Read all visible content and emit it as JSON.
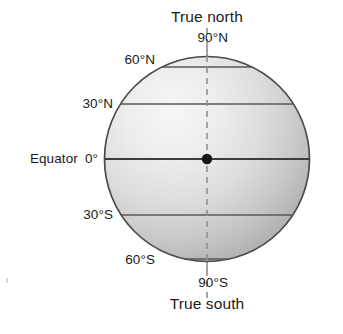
{
  "diagram": {
    "labels": {
      "true_north": "True north",
      "true_south": "True south",
      "pole_north": "90°N",
      "pole_south": "90°S",
      "lat_60n": "60°N",
      "lat_30n": "30°N",
      "equator_name": "Equator",
      "equator_value": "0°",
      "lat_30s": "30°S",
      "lat_60s": "60°S"
    },
    "colors": {
      "outline": "#4a4a4a",
      "latitude_line": "#5a5a5a",
      "axis_dash": "#8a8a8a",
      "center_dot": "#1a1a1a",
      "globe_light": "#f2f2f2",
      "globe_mid": "#d6d6d6",
      "globe_dark": "#adadad",
      "text": "#1a1a1a",
      "background": "#ffffff"
    },
    "geometry": {
      "center_x": 207,
      "center_y": 159,
      "radius": 103,
      "axis_top_y": 28,
      "axis_bottom_y": 300
    },
    "latitudes": [
      {
        "name": "90°N",
        "degrees": 90,
        "y": 45
      },
      {
        "name": "60°N",
        "degrees": 60,
        "y": 67
      },
      {
        "name": "30°N",
        "degrees": 30,
        "y": 104
      },
      {
        "name": "0°",
        "degrees": 0,
        "y": 159
      },
      {
        "name": "30°S",
        "degrees": -30,
        "y": 215
      },
      {
        "name": "60°S",
        "degrees": -60,
        "y": 259
      },
      {
        "name": "90°S",
        "degrees": -90,
        "y": 273
      }
    ]
  }
}
